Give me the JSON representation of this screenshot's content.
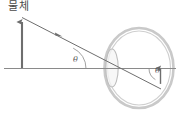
{
  "figure": {
    "title_label": "물체",
    "type": "optics-ray-diagram",
    "angles": {
      "left_symbol": "θ",
      "right_symbol": "θ"
    },
    "colors": {
      "line": "#6e6e6e",
      "axis": "#7a7a7a",
      "eye_outer": "#c9c9c9",
      "eye_inner": "#bdbdbd",
      "lens": "#bdbdbd",
      "text": "#4a4a4a",
      "background": "#ffffff"
    },
    "geometry": {
      "axis_y": 68,
      "axis_x_start": 4,
      "axis_x_end": 176,
      "object_x": 22,
      "object_top_y": 17,
      "object_bottom_y": 68,
      "ray_start_x": 22,
      "ray_start_y": 17,
      "ray_end_x": 160,
      "ray_end_y": 88,
      "eye_center_x": 139,
      "eye_center_y": 68,
      "eye_radius_x": 34,
      "eye_radius_y": 40,
      "lens_center_x": 112,
      "lens_center_y": 68,
      "lens_radius_x": 6,
      "lens_radius_y": 19,
      "image_x": 160,
      "image_top_y": 68,
      "image_bottom_y": 88
    }
  }
}
